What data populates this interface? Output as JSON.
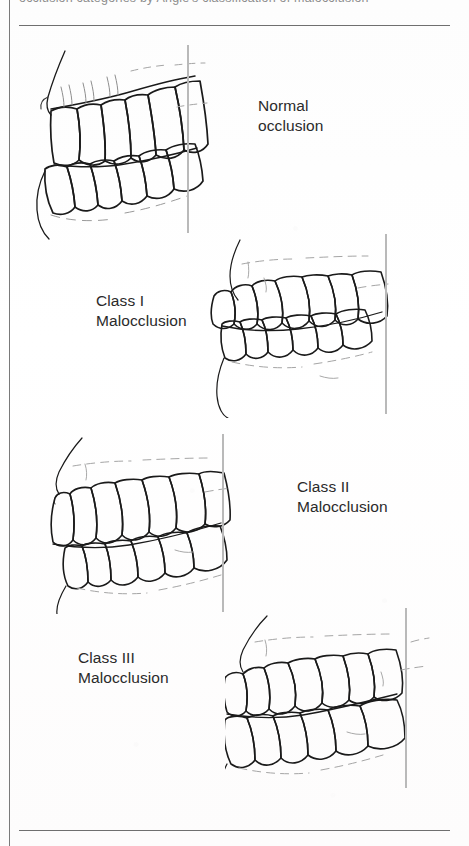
{
  "figure": {
    "header_partial_text": "occlusion categories by Angle's classification of malocclusion",
    "background_color": "#fefefe",
    "ink_color": "#1a1a1a",
    "reference_line_color": "#b9b9b9",
    "rule_color": "#6f6f6f",
    "label_color": "#2a2a2a"
  },
  "panels": [
    {
      "id": "normal-occlusion",
      "label": "Normal\nocclusion",
      "label_x": 258,
      "label_y": 96,
      "art_x": 25,
      "art_y": 45,
      "art_w": 190,
      "art_h": 190,
      "ref_line_x": 187,
      "ref_line_y": 45,
      "ref_line_h": 188,
      "tooth_side": "left",
      "description": "Upper and lower dental arch in profile, molars aligned at reference line"
    },
    {
      "id": "class-i-malocclusion",
      "label": "Class I\nMalocclusion",
      "label_x": 96,
      "label_y": 291,
      "art_x": 210,
      "art_y": 236,
      "art_w": 195,
      "art_h": 180,
      "ref_line_x": 385,
      "ref_line_y": 234,
      "ref_line_h": 180,
      "tooth_side": "right",
      "description": "Crowded anterior teeth with normal molar relationship"
    },
    {
      "id": "class-ii-malocclusion",
      "label": "Class II\nMalocclusion",
      "label_x": 297,
      "label_y": 477,
      "art_x": 25,
      "art_y": 436,
      "art_w": 215,
      "art_h": 175,
      "ref_line_x": 222,
      "ref_line_y": 434,
      "ref_line_h": 178,
      "tooth_side": "left",
      "description": "Retrognathic relationship, lower molar distal to reference line"
    },
    {
      "id": "class-iii-malocclusion",
      "label": "Class III\nMalocclusion",
      "label_x": 78,
      "label_y": 648,
      "art_x": 225,
      "art_y": 612,
      "art_w": 205,
      "art_h": 175,
      "ref_line_x": 405,
      "ref_line_y": 608,
      "ref_line_h": 180,
      "tooth_side": "right",
      "description": "Prognathic relationship, lower molar mesial to reference line"
    }
  ],
  "rules": {
    "top_y": 25,
    "bottom_y": 830,
    "left_x": 9
  }
}
